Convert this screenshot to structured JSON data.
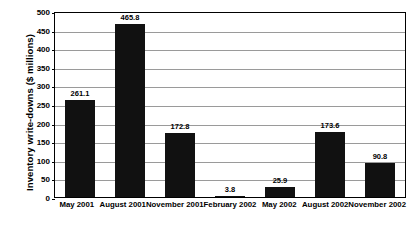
{
  "chart_data": {
    "type": "bar",
    "title": "",
    "xlabel": "",
    "ylabel": "Inventory write-downs ($ millions)",
    "ylim": [
      0,
      500
    ],
    "yticks": [
      0,
      50,
      100,
      150,
      200,
      250,
      300,
      350,
      400,
      450,
      500
    ],
    "ytick_labels": [
      "0",
      "50",
      "100",
      "150",
      "200",
      "250",
      "300",
      "350",
      "400",
      "450",
      "500"
    ],
    "grid": true,
    "legend": false,
    "bar_color": "#111111",
    "categories": [
      "May 2001",
      "August 2001",
      "November 2001",
      "February 2002",
      "May 2002",
      "August 2002",
      "November 2002"
    ],
    "values": [
      261.1,
      465.8,
      172.8,
      3.8,
      25.9,
      173.6,
      90.8
    ],
    "value_labels": [
      "261.1",
      "465.8",
      "172.8",
      "3.8",
      "25.9",
      "173.6",
      "90.8"
    ]
  }
}
